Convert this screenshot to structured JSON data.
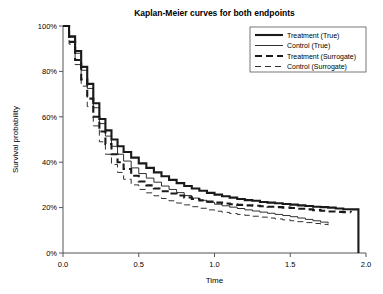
{
  "chart_data": {
    "type": "line",
    "title": "Kaplan-Meier  curves for both endpoints",
    "xlabel": "Time",
    "ylabel": "Survival probability",
    "xlim": [
      0.0,
      2.0
    ],
    "ylim": [
      0,
      100
    ],
    "xticks": [
      0.0,
      0.5,
      1.0,
      1.5,
      2.0
    ],
    "xticklabels": [
      "0.0",
      "0.5",
      "1.0",
      "1.5",
      "2.0"
    ],
    "yticks": [
      0,
      20,
      40,
      60,
      80,
      100
    ],
    "yticklabels": [
      "0%",
      "20%",
      "40%",
      "60%",
      "80%",
      "100%"
    ],
    "grid": false,
    "legend_position": "upper right",
    "series": [
      {
        "name": "Treatment (True)",
        "style": "solid",
        "width": 2.1,
        "color": "#1a1a1a",
        "x": [
          0.0,
          0.04,
          0.08,
          0.12,
          0.16,
          0.2,
          0.24,
          0.28,
          0.32,
          0.36,
          0.4,
          0.45,
          0.5,
          0.55,
          0.6,
          0.65,
          0.7,
          0.75,
          0.8,
          0.85,
          0.9,
          0.95,
          1.0,
          1.05,
          1.1,
          1.15,
          1.2,
          1.25,
          1.3,
          1.35,
          1.4,
          1.45,
          1.5,
          1.55,
          1.6,
          1.65,
          1.7,
          1.75,
          1.8,
          1.85,
          1.9,
          1.95,
          1.95
        ],
        "y": [
          100.0,
          95.5,
          89.0,
          82.0,
          74.5,
          66.0,
          59.0,
          54.0,
          50.0,
          47.0,
          44.5,
          42.0,
          39.5,
          37.5,
          35.5,
          33.8,
          32.2,
          30.8,
          29.5,
          28.4,
          27.4,
          26.5,
          25.7,
          25.0,
          24.4,
          23.8,
          23.3,
          23.0,
          22.5,
          22.2,
          21.9,
          21.6,
          21.3,
          21.0,
          20.7,
          20.4,
          20.2,
          20.0,
          19.6,
          19.3,
          19.2,
          19.0,
          0.0
        ]
      },
      {
        "name": "Control (True)",
        "style": "solid",
        "width": 0.9,
        "color": "#1a1a1a",
        "x": [
          0.0,
          0.04,
          0.08,
          0.12,
          0.16,
          0.2,
          0.24,
          0.28,
          0.32,
          0.36,
          0.4,
          0.45,
          0.5,
          0.55,
          0.6,
          0.65,
          0.7,
          0.75,
          0.8,
          0.85,
          0.9,
          0.95,
          1.0,
          1.05,
          1.1,
          1.15,
          1.2,
          1.25,
          1.3,
          1.35,
          1.4,
          1.45,
          1.5,
          1.55,
          1.6,
          1.65,
          1.7,
          1.75
        ],
        "y": [
          100.0,
          95.0,
          88.0,
          80.5,
          72.5,
          64.0,
          57.0,
          51.5,
          47.0,
          43.5,
          40.5,
          37.5,
          35.0,
          33.0,
          31.2,
          29.5,
          28.0,
          26.6,
          25.3,
          24.2,
          23.2,
          22.3,
          21.5,
          20.8,
          20.2,
          19.6,
          19.0,
          18.5,
          18.0,
          17.5,
          17.0,
          16.5,
          16.0,
          15.4,
          14.8,
          14.2,
          13.6,
          13.0
        ]
      },
      {
        "name": "Treatment (Surrogate)",
        "style": "dashed",
        "width": 2.1,
        "color": "#1a1a1a",
        "dash": "7,4",
        "x": [
          0.0,
          0.04,
          0.08,
          0.12,
          0.16,
          0.2,
          0.24,
          0.28,
          0.32,
          0.36,
          0.4,
          0.45,
          0.5,
          0.55,
          0.6,
          0.65,
          0.7,
          0.75,
          0.8,
          0.85,
          0.9,
          0.95,
          1.0,
          1.05,
          1.1,
          1.15,
          1.2,
          1.25,
          1.3,
          1.35,
          1.4,
          1.45,
          1.5,
          1.55,
          1.6,
          1.65,
          1.7,
          1.75,
          1.8,
          1.85,
          1.9
        ],
        "y": [
          100.0,
          93.0,
          85.0,
          76.5,
          68.0,
          60.0,
          53.5,
          48.0,
          43.5,
          40.0,
          37.0,
          34.0,
          31.5,
          29.8,
          28.4,
          27.2,
          26.2,
          25.3,
          24.5,
          23.8,
          23.2,
          22.7,
          22.2,
          21.8,
          21.5,
          21.2,
          21.0,
          20.8,
          20.6,
          20.4,
          20.2,
          20.0,
          19.8,
          19.5,
          19.2,
          18.9,
          18.6,
          18.3,
          18.1,
          18.0,
          17.9
        ]
      },
      {
        "name": "Control (Surrogate)",
        "style": "dashed",
        "width": 0.9,
        "color": "#1a1a1a",
        "dash": "6,4",
        "x": [
          0.0,
          0.04,
          0.08,
          0.12,
          0.16,
          0.2,
          0.24,
          0.28,
          0.32,
          0.36,
          0.4,
          0.45,
          0.5,
          0.55,
          0.6,
          0.65,
          0.7,
          0.75,
          0.8,
          0.85,
          0.9,
          0.95,
          1.0,
          1.05,
          1.1,
          1.15,
          1.2,
          1.25,
          1.3,
          1.35,
          1.4,
          1.45,
          1.5,
          1.55,
          1.6,
          1.65,
          1.7,
          1.75
        ],
        "y": [
          100.0,
          92.0,
          83.0,
          73.5,
          64.5,
          56.0,
          49.0,
          43.5,
          39.0,
          35.5,
          32.5,
          30.0,
          28.0,
          26.5,
          25.2,
          24.0,
          23.0,
          22.0,
          21.2,
          20.4,
          19.7,
          19.0,
          18.4,
          17.9,
          17.4,
          17.0,
          16.6,
          16.2,
          15.8,
          15.4,
          15.0,
          14.6,
          14.2,
          13.8,
          13.4,
          13.0,
          12.6,
          12.2
        ]
      }
    ]
  },
  "legend": {
    "items": [
      {
        "label": "Treatment (True)"
      },
      {
        "label": "Control (True)"
      },
      {
        "label": "Treatment (Surrogate)"
      },
      {
        "label": "Control (Surrogate)"
      }
    ]
  },
  "colors": {
    "axis": "#555555",
    "line": "#1a1a1a",
    "background": "#ffffff"
  }
}
